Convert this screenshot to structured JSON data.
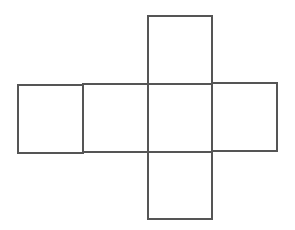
{
  "diagram": {
    "type": "cube-net",
    "stroke_color": "#555555",
    "background": "#ffffff",
    "faces": [
      {
        "id": "top",
        "x": 148,
        "y": 16,
        "w": 64,
        "h": 68
      },
      {
        "id": "far-left",
        "x": 18,
        "y": 85,
        "w": 65,
        "h": 68
      },
      {
        "id": "left",
        "x": 83,
        "y": 84,
        "w": 65,
        "h": 68
      },
      {
        "id": "center",
        "x": 148,
        "y": 84,
        "w": 64,
        "h": 68
      },
      {
        "id": "right",
        "x": 212,
        "y": 83,
        "w": 65,
        "h": 68
      },
      {
        "id": "bottom",
        "x": 148,
        "y": 152,
        "w": 64,
        "h": 67
      }
    ]
  }
}
